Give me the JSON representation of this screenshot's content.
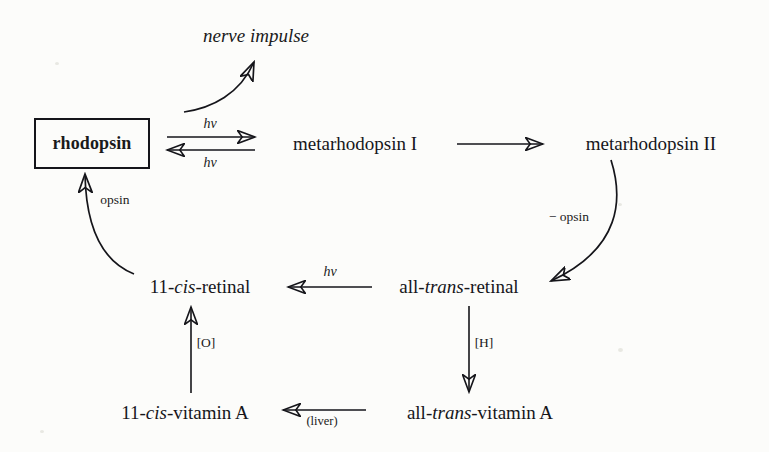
{
  "diagram": {
    "background_color": "#fcfcfa",
    "ink_color": "#15151a",
    "nodes": {
      "rhodopsin": "rhodopsin",
      "nerve_impulse": "nerve impulse",
      "metarhodopsin_1": "metarhodopsin I",
      "metarhodopsin_2": "metarhodopsin II",
      "cis_retinal_prefix": "11-",
      "cis_retinal_ital": "cis",
      "cis_retinal_suffix": "-retinal",
      "trans_retinal_prefix": "all-",
      "trans_retinal_ital": "trans",
      "trans_retinal_suffix": "-retinal",
      "cis_vitamin_prefix": "11-",
      "cis_vitamin_ital": "cis",
      "cis_vitamin_suffix": "-vitamin A",
      "trans_vitamin_prefix": "all-",
      "trans_vitamin_ital": "trans",
      "trans_vitamin_suffix": "-vitamin A"
    },
    "edge_labels": {
      "hv_forward": "hv",
      "hv_reverse": "hv",
      "hv_isomerize": "hv",
      "minus_opsin": "− opsin",
      "opsin": "opsin",
      "oxidation": "[O]",
      "reduction": "[H]",
      "liver": "(liver)"
    }
  }
}
